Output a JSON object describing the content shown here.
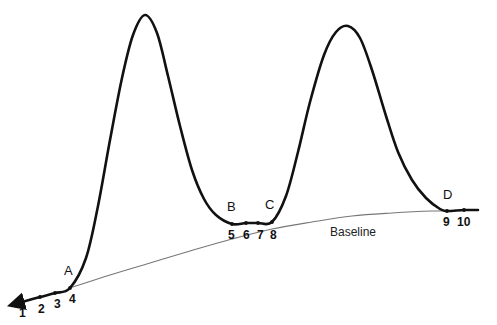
{
  "figure": {
    "background_color": "#ffffff",
    "curve_color": "#111111",
    "baseline_color": "#777777",
    "width": 497,
    "height": 325
  },
  "annotations": {
    "baseline_label": "Baseline",
    "letters": [
      {
        "text": "A",
        "x": 64,
        "y": 264
      },
      {
        "text": "B",
        "x": 227,
        "y": 200
      },
      {
        "text": "C",
        "x": 265,
        "y": 198
      },
      {
        "text": "D",
        "x": 443,
        "y": 188
      }
    ],
    "numbers": [
      {
        "text": "1",
        "x": 19,
        "y": 307
      },
      {
        "text": "2",
        "x": 38,
        "y": 303
      },
      {
        "text": "3",
        "x": 54,
        "y": 298
      },
      {
        "text": "4",
        "x": 69,
        "y": 293
      },
      {
        "text": "5",
        "x": 228,
        "y": 229
      },
      {
        "text": "6",
        "x": 243,
        "y": 229
      },
      {
        "text": "7",
        "x": 257,
        "y": 229
      },
      {
        "text": "8",
        "x": 270,
        "y": 229
      },
      {
        "text": "9",
        "x": 443,
        "y": 216
      },
      {
        "text": "10",
        "x": 457,
        "y": 216
      }
    ]
  },
  "chart_data": {
    "type": "line",
    "xlabel": "",
    "ylabel": "",
    "xlim": [
      0,
      497
    ],
    "ylim": [
      325,
      0
    ],
    "grid": false,
    "legend": null,
    "series": [
      {
        "name": "signal",
        "style": "thick-solid",
        "color": "#111111",
        "comment": "Detector trace: leading arrow, peak 1, valley, peak 2, trailing flat tail",
        "points": [
          [
            22,
            302
          ],
          [
            40,
            297
          ],
          [
            55,
            293
          ],
          [
            70,
            288
          ],
          [
            86,
            258
          ],
          [
            98,
            206
          ],
          [
            110,
            140
          ],
          [
            122,
            78
          ],
          [
            133,
            35
          ],
          [
            145,
            15
          ],
          [
            157,
            33
          ],
          [
            168,
            76
          ],
          [
            180,
            126
          ],
          [
            192,
            170
          ],
          [
            204,
            199
          ],
          [
            216,
            215
          ],
          [
            232,
            224
          ],
          [
            246,
            223
          ],
          [
            258,
            223
          ],
          [
            272,
            222
          ],
          [
            286,
            196
          ],
          [
            298,
            152
          ],
          [
            310,
            102
          ],
          [
            324,
            55
          ],
          [
            336,
            32
          ],
          [
            348,
            26
          ],
          [
            360,
            38
          ],
          [
            372,
            70
          ],
          [
            386,
            116
          ],
          [
            398,
            152
          ],
          [
            412,
            180
          ],
          [
            426,
            198
          ],
          [
            440,
            209
          ],
          [
            447,
            211
          ],
          [
            464,
            210
          ],
          [
            478,
            210
          ]
        ]
      },
      {
        "name": "baseline",
        "style": "thin-solid",
        "color": "#777777",
        "comment": "Interpolated curved baseline drawn from A to beyond D",
        "points": [
          [
            70,
            288
          ],
          [
            110,
            275
          ],
          [
            150,
            263
          ],
          [
            190,
            251
          ],
          [
            232,
            239
          ],
          [
            272,
            229
          ],
          [
            312,
            222
          ],
          [
            352,
            216
          ],
          [
            392,
            213
          ],
          [
            432,
            211
          ],
          [
            478,
            210
          ]
        ]
      }
    ],
    "markers": [
      {
        "label": "A",
        "number": null,
        "x": 70,
        "y": 288,
        "on": "signal"
      },
      {
        "label": null,
        "number": "1",
        "x": 22,
        "y": 302,
        "on": "signal"
      },
      {
        "label": null,
        "number": "2",
        "x": 40,
        "y": 297,
        "on": "signal"
      },
      {
        "label": null,
        "number": "3",
        "x": 55,
        "y": 293,
        "on": "signal"
      },
      {
        "label": null,
        "number": "4",
        "x": 70,
        "y": 288,
        "on": "signal"
      },
      {
        "label": "B",
        "number": "5",
        "x": 232,
        "y": 224,
        "on": "signal"
      },
      {
        "label": null,
        "number": "6",
        "x": 246,
        "y": 223,
        "on": "signal"
      },
      {
        "label": null,
        "number": "7",
        "x": 258,
        "y": 223,
        "on": "signal"
      },
      {
        "label": "C",
        "number": "8",
        "x": 272,
        "y": 222,
        "on": "signal"
      },
      {
        "label": "D",
        "number": "9",
        "x": 447,
        "y": 211,
        "on": "signal"
      },
      {
        "label": null,
        "number": "10",
        "x": 464,
        "y": 210,
        "on": "signal"
      }
    ],
    "peaks": [
      {
        "name": "peak-1",
        "apex_x": 145,
        "apex_y": 15,
        "start": "A",
        "end": "B"
      },
      {
        "name": "peak-2",
        "apex_x": 348,
        "apex_y": 26,
        "start": "C",
        "end": "D"
      }
    ]
  }
}
